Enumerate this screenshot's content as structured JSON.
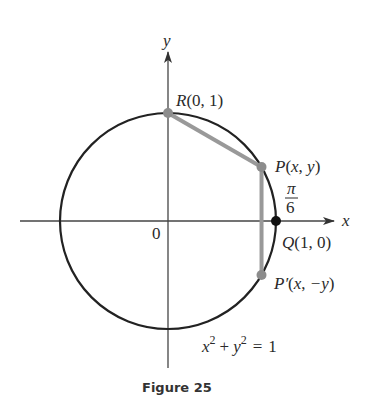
{
  "figure": {
    "caption": "Figure 25",
    "equation": {
      "x": "x",
      "exp1": "2",
      "plus": "+",
      "y": "y",
      "exp2": "2",
      "eq": "=",
      "rhs": "1"
    },
    "axes": {
      "x_label": "x",
      "y_label": "y",
      "origin_label": "0"
    },
    "points": {
      "R": {
        "name": "R",
        "coords": "(0, 1)"
      },
      "P": {
        "name": "P",
        "coords_open": "(",
        "x": "x",
        "comma": ", ",
        "y": "y",
        "coords_close": ")"
      },
      "Q": {
        "name": "Q",
        "coords": "(1, 0)"
      },
      "P_prime": {
        "name": "P′",
        "coords_open": "(",
        "x": "x",
        "comma": ", ",
        "y": "−y",
        "coords_close": ")"
      }
    },
    "angle_label": {
      "numerator": "π",
      "denominator": "6"
    },
    "angle_radians": 0.5235987756,
    "colors": {
      "circle": "#222222",
      "chords": "#999999",
      "points": "#8c8c8c",
      "q_point": "#111111",
      "axes": "#444444"
    }
  }
}
